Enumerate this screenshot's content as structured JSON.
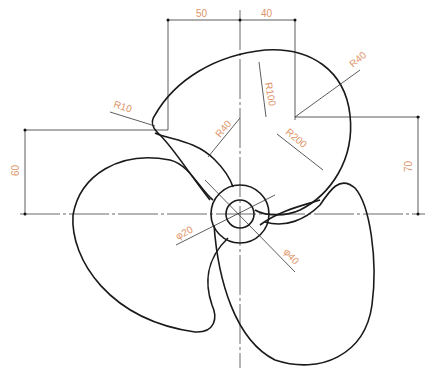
{
  "drawing": {
    "title": "Propeller",
    "colors": {
      "outline": "#1a1a1a",
      "dimension_text": "#e0956a",
      "dimension_line": "#333333"
    },
    "dimensions": {
      "horizontal_left": "50",
      "horizontal_right": "40",
      "vertical_left": "60",
      "vertical_right": "70",
      "r10": "R10",
      "r40_left": "R40",
      "r40_right": "R40",
      "r100": "R100",
      "r200": "R200",
      "phi20": "φ20",
      "phi40": "φ40"
    }
  }
}
